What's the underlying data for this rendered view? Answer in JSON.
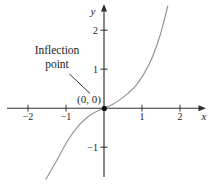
{
  "page": {
    "background": "#ffffff"
  },
  "annotation": {
    "line1": "Inflection",
    "line2": "point",
    "origin_label": "(0, 0)"
  },
  "chart_data": {
    "type": "line",
    "title": "",
    "xlabel": "x",
    "ylabel": "y",
    "x_ticks": [
      -2,
      -1,
      1,
      2
    ],
    "y_ticks": [
      -1,
      1,
      2
    ],
    "xlim": [
      -2.6,
      2.75
    ],
    "ylim": [
      -1.95,
      2.7
    ],
    "grid": false,
    "legend": "none",
    "axis_color": "#2e2e2e",
    "curve_color": "#929292",
    "text_color": "#1c1c1c",
    "dot_color": "#141414",
    "series": [
      {
        "name": "cubic curve through origin (y = x^3 shape)",
        "x": [
          -1.53,
          -1.24,
          -0.95,
          -0.68,
          -0.42,
          -0.21,
          0,
          0.21,
          0.42,
          0.63,
          0.84,
          1.05,
          1.26,
          1.47,
          1.68
        ],
        "y": [
          -1.82,
          -1.33,
          -0.82,
          -0.46,
          -0.22,
          -0.09,
          0,
          0.09,
          0.22,
          0.38,
          0.58,
          0.88,
          1.28,
          1.85,
          2.62
        ]
      }
    ],
    "points_of_interest": [
      {
        "x": 0,
        "y": 0,
        "label": "(0, 0)",
        "annotation": "Inflection point",
        "marker": "filled-dot"
      }
    ]
  }
}
